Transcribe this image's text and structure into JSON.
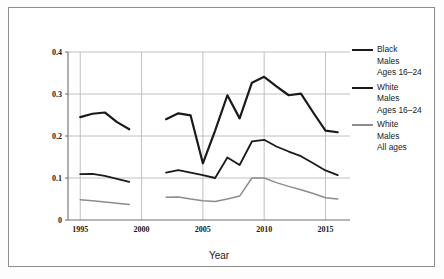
{
  "figure": {
    "frame": true,
    "background": "#ffffff"
  },
  "axes": {
    "x_title": "Year",
    "y_title": "",
    "x_ticks": [
      "1995",
      "2000",
      "2005",
      "2010",
      "2015"
    ],
    "y_ticks": [
      "0",
      "0.1",
      "0.2",
      "0.3",
      "0.4"
    ]
  },
  "legend": {
    "position": "right",
    "entries": [
      {
        "color": "#1a1a1a",
        "width": 2.2,
        "line1": "Black",
        "line2": "Males",
        "line3": "Ages 16–24"
      },
      {
        "color": "#1a1a1a",
        "width": 1.8,
        "line1": "White",
        "line2": "Males",
        "line3": "Ages 16–24"
      },
      {
        "color": "#8c8c8c",
        "width": 1.5,
        "line1": "White",
        "line2": "Males",
        "line3": "All ages"
      }
    ]
  },
  "chart_data": {
    "type": "line",
    "title": "",
    "xlabel": "Year",
    "ylabel": "",
    "xlim": [
      1994,
      2017
    ],
    "ylim": [
      0,
      0.4
    ],
    "grid": true,
    "gridlines_y": [
      0.1,
      0.2,
      0.3,
      0.4
    ],
    "gridlines_x": [
      1995,
      2000,
      2005,
      2010,
      2015
    ],
    "xticks": [
      1995,
      2000,
      2005,
      2010,
      2015
    ],
    "yticks": [
      0,
      0.1,
      0.2,
      0.3,
      0.4
    ],
    "series": [
      {
        "name": "Black Males Ages 16-24",
        "color": "#1a1a1a",
        "width": 2.2,
        "segments": [
          {
            "x": [
              1995,
              1996,
              1997,
              1998,
              1999
            ],
            "y": [
              0.245,
              0.253,
              0.256,
              0.233,
              0.216
            ]
          },
          {
            "x": [
              2002,
              2003,
              2004,
              2005,
              2006,
              2007,
              2008,
              2009,
              2010,
              2011,
              2012,
              2013,
              2014,
              2015,
              2016
            ],
            "y": [
              0.24,
              0.254,
              0.249,
              0.135,
              0.213,
              0.297,
              0.242,
              0.327,
              0.341,
              0.318,
              0.297,
              0.301,
              0.256,
              0.213,
              0.209
            ]
          }
        ]
      },
      {
        "name": "White Males Ages 16-24",
        "color": "#1a1a1a",
        "width": 1.8,
        "segments": [
          {
            "x": [
              1995,
              1996,
              1997,
              1998,
              1999
            ],
            "y": [
              0.109,
              0.11,
              0.105,
              0.098,
              0.091
            ]
          },
          {
            "x": [
              2002,
              2003,
              2004,
              2005,
              2006,
              2007,
              2008,
              2009,
              2010,
              2011,
              2012,
              2013,
              2014,
              2015,
              2016
            ],
            "y": [
              0.113,
              0.119,
              0.113,
              0.107,
              0.1,
              0.149,
              0.131,
              0.187,
              0.191,
              0.175,
              0.163,
              0.152,
              0.135,
              0.118,
              0.107
            ]
          }
        ]
      },
      {
        "name": "White Males All ages",
        "color": "#8c8c8c",
        "width": 1.5,
        "segments": [
          {
            "x": [
              1995,
              1996,
              1997,
              1998,
              1999
            ],
            "y": [
              0.048,
              0.046,
              0.043,
              0.04,
              0.037
            ]
          },
          {
            "x": [
              2002,
              2003,
              2004,
              2005,
              2006,
              2007,
              2008,
              2009,
              2010,
              2011,
              2012,
              2013,
              2014,
              2015,
              2016
            ],
            "y": [
              0.054,
              0.055,
              0.05,
              0.046,
              0.044,
              0.05,
              0.057,
              0.1,
              0.1,
              0.089,
              0.08,
              0.072,
              0.063,
              0.053,
              0.05
            ]
          }
        ]
      }
    ]
  },
  "geometry": {
    "plot_left": 68,
    "plot_right": 350,
    "plot_top": 52,
    "plot_bottom": 220
  }
}
